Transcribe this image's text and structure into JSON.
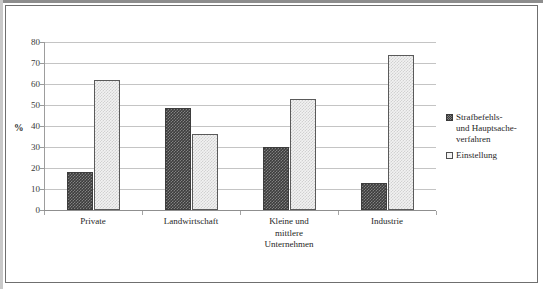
{
  "chart_data": {
    "type": "bar",
    "title": "",
    "xlabel": "",
    "ylabel": "%",
    "ylim": [
      0,
      80
    ],
    "ytick_step": 10,
    "yticks": [
      80,
      70,
      60,
      50,
      40,
      30,
      20,
      10,
      0
    ],
    "grid": true,
    "legend_position": "right",
    "categories": [
      "Private",
      "Landwirtschaft",
      "Kleine und\nmittlere\nUnternehmen",
      "Industrie"
    ],
    "series": [
      {
        "name": "Strafbefehls-\nund Hauptsache-\nverfahren",
        "values": [
          18,
          48.5,
          30,
          13
        ],
        "swatch": "dark"
      },
      {
        "name": "Einstellung",
        "values": [
          62,
          36,
          53,
          74
        ],
        "swatch": "light"
      }
    ]
  },
  "legend": {
    "entries": [
      {
        "label": "Strafbefehls-\nund Hauptsache-\nverfahren",
        "swatch": "dark"
      },
      {
        "label": "Einstellung",
        "swatch": "light"
      }
    ]
  },
  "colors": {
    "series_dark": "#3c3c3c",
    "series_light": "#f2f2f2",
    "gridline": "#c4c4c4",
    "axis": "#8f8f8f",
    "frame": "#6f6f6f",
    "text": "#262626",
    "background": "#ffffff"
  }
}
